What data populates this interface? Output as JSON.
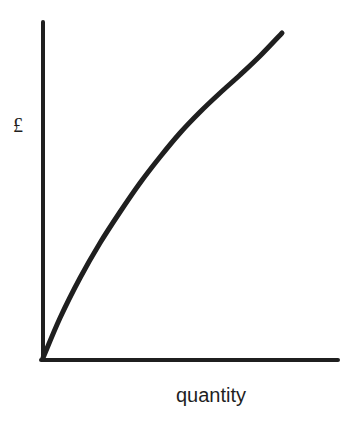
{
  "chart_data": {
    "type": "line",
    "title": "",
    "xlabel": "quantity",
    "ylabel": "£",
    "grid": false,
    "legend": null,
    "ticks": {
      "x": [],
      "y": []
    },
    "series": [
      {
        "name": "curve",
        "color": "#1f1f1f",
        "points_px": [
          [
            43,
            358
          ],
          [
            60,
            318
          ],
          [
            80,
            278
          ],
          [
            100,
            243
          ],
          [
            120,
            212
          ],
          [
            140,
            183
          ],
          [
            160,
            157
          ],
          [
            180,
            133
          ],
          [
            200,
            112
          ],
          [
            220,
            93
          ],
          [
            240,
            75
          ],
          [
            260,
            56
          ],
          [
            282,
            33
          ]
        ]
      }
    ]
  },
  "labels": {
    "y_axis": "£",
    "x_axis": "quantity"
  },
  "colors": {
    "ink": "#1f1f1f",
    "background": "#ffffff"
  }
}
